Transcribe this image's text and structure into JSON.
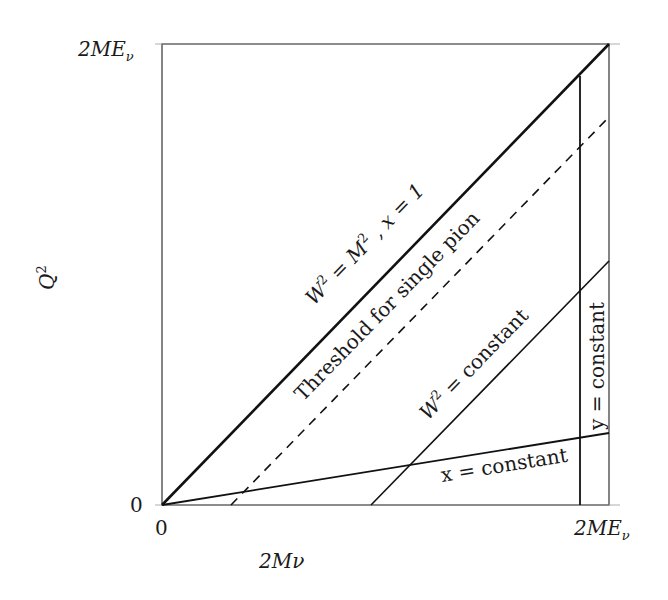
{
  "diagram": {
    "type": "kinematic-region",
    "axes": {
      "x_label": "2Mν",
      "y_label": "Q²",
      "x_min_label": "0",
      "x_max_label": "2MEν",
      "y_min_label": "0",
      "y_max_label": "2MEν"
    },
    "lines": [
      {
        "name": "diagonal-x1",
        "label": "W² = M² , x = 1",
        "style": "solid-thick"
      },
      {
        "name": "single-pion-threshold",
        "label": "Threshold for single pion",
        "style": "dashed"
      },
      {
        "name": "w2-constant",
        "label": "W² = constant",
        "style": "solid"
      },
      {
        "name": "x-constant",
        "label": "x = constant",
        "style": "solid"
      },
      {
        "name": "y-constant",
        "label": "y = constant",
        "style": "solid"
      }
    ]
  },
  "labels": {
    "y_axis": "Q",
    "y_axis_sup": "2",
    "x_axis": "2Mν",
    "y_top": "2ME",
    "y_top_sub": "ν",
    "x_right": "2ME",
    "x_right_sub": "ν",
    "y_zero": "0",
    "x_zero": "0",
    "diag_a": "W",
    "diag_b": "2",
    "diag_c": " = M",
    "diag_d": "2",
    "diag_e": " , x = 1",
    "threshold": "Threshold for single pion",
    "w2const_a": "W",
    "w2const_b": "2",
    "w2const_c": " = constant",
    "xconst": "x = constant",
    "yconst": "y = constant"
  }
}
